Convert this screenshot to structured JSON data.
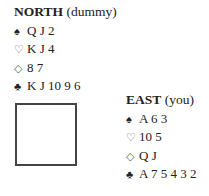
{
  "north": {
    "name": "NORTH",
    "role": "(dummy)",
    "spades": "Q J 2",
    "hearts": "K J 4",
    "diamonds": "8 7",
    "clubs": "K J 10 9 6"
  },
  "east": {
    "name": "EAST",
    "role": "(you)",
    "spades": "A 6 3",
    "hearts": "10 5",
    "diamonds": "Q J",
    "clubs": "A 7 5 4 3 2"
  },
  "icons": {
    "spade": "♠",
    "heart": "♡",
    "diamond": "◇",
    "club": "♣"
  }
}
